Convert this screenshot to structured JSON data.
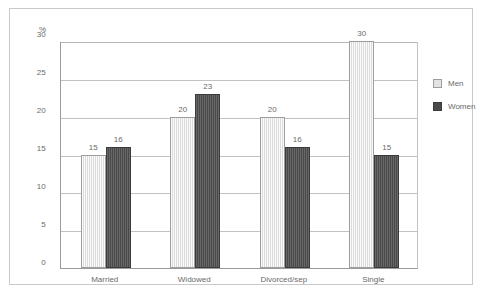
{
  "chart_data": {
    "type": "bar",
    "title": "",
    "xlabel": "",
    "ylabel": "%",
    "ylim": [
      0,
      30
    ],
    "yticks": [
      0,
      5,
      10,
      15,
      20,
      25,
      30
    ],
    "grid": "horizontal",
    "legend_position": "right",
    "categories": [
      "Married",
      "Widowed",
      "Divorced/sep",
      "Single"
    ],
    "series": [
      {
        "name": "Men",
        "color": "#e3e3e3",
        "values": [
          15,
          20,
          20,
          30
        ]
      },
      {
        "name": "Women",
        "color": "#4a4a4a",
        "values": [
          16,
          23,
          16,
          15
        ]
      }
    ]
  },
  "axis": {
    "y_title": "%",
    "tick_labels": [
      "30",
      "25",
      "20",
      "15",
      "10",
      "5",
      "0"
    ]
  },
  "legend": {
    "items": [
      {
        "label": "Men"
      },
      {
        "label": "Women"
      }
    ]
  },
  "caption": {
    "text": ""
  }
}
